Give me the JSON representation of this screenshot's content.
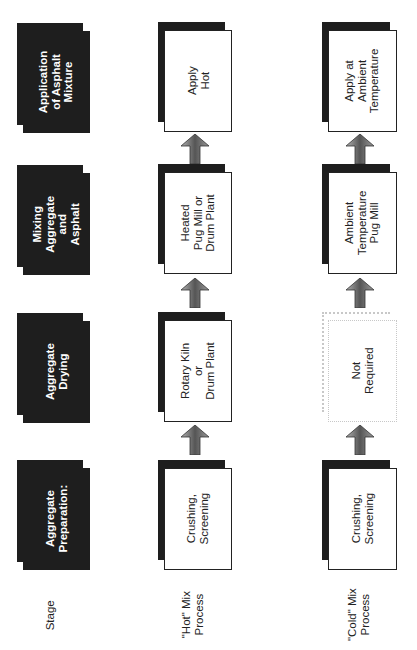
{
  "stages": [
    {
      "label": "Application\nof Asphalt\nMixture"
    },
    {
      "label": "Mixing\nAggregate\nand\nAsphalt"
    },
    {
      "label": "Aggregate\nDrying"
    },
    {
      "label": "Aggregate\nPreparation:"
    }
  ],
  "hot_process": [
    {
      "label": "Apply\nHot"
    },
    {
      "label": "Heated\nPug Mill or\nDrum Plant"
    },
    {
      "label": "Rotary Kiln\nor\nDrum Plant"
    },
    {
      "label": "Crushing,\nScreening"
    }
  ],
  "cold_process": [
    {
      "label": "Apply at\nAmbient\nTemperature"
    },
    {
      "label": "Ambient\nTemperature\nPug Mill"
    },
    {
      "label": "Not\nRequired"
    },
    {
      "label": "Crushing,\nScreening"
    }
  ],
  "row_labels": {
    "stage": "Stage",
    "hot": "\"Hot\" Mix\nProcess",
    "cold": "\"Cold\" Mix\nProcess"
  },
  "colors": {
    "stage_fill": "#1e1e1e",
    "arrow_gradient": [
      "#9a9a9a",
      "#3a3a3a"
    ],
    "ghost_border": "#c8c8c8"
  }
}
